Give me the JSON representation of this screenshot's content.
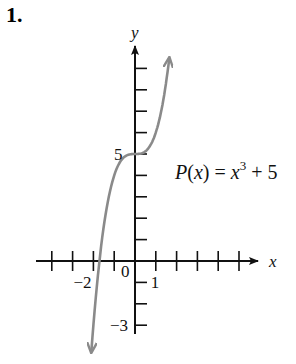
{
  "problem_number": "1.",
  "chart_data": {
    "type": "line",
    "title": "",
    "function_label": "P(x) = x^3 + 5",
    "function_label_parts": {
      "lhs": "P(x) = x",
      "exp": "3",
      "rhs": " + 5"
    },
    "xlabel": "x",
    "ylabel": "y",
    "x_tick_labels": [
      {
        "value": -2,
        "label": "−2"
      },
      {
        "value": 0,
        "label": "0"
      },
      {
        "value": 1,
        "label": "1"
      }
    ],
    "y_tick_labels": [
      {
        "value": 5,
        "label": "5"
      },
      {
        "value": -3,
        "label": "−3"
      }
    ],
    "xlim": [
      -4.5,
      5.6
    ],
    "ylim": [
      -3.6,
      10
    ],
    "x_ticks": [
      -4,
      -3,
      -2,
      -1,
      1,
      2,
      3,
      4,
      5
    ],
    "y_ticks": [
      -3,
      -2,
      -1,
      1,
      2,
      3,
      4,
      5,
      6,
      7,
      8,
      9
    ],
    "grid": false,
    "legend": "none",
    "series": [
      {
        "name": "P(x) = x^3 + 5",
        "color": "#8a8a8a",
        "x": [
          -2.1,
          -2,
          -1.5,
          -1,
          -0.5,
          0,
          0.5,
          1,
          1.5,
          1.65
        ],
        "values": [
          -4.26,
          -3,
          1.63,
          4,
          4.88,
          5,
          5.13,
          6,
          8.38,
          9.49
        ]
      }
    ]
  },
  "colors": {
    "axis": "#111111",
    "curve": "#8a8a8a",
    "background": "#ffffff"
  }
}
